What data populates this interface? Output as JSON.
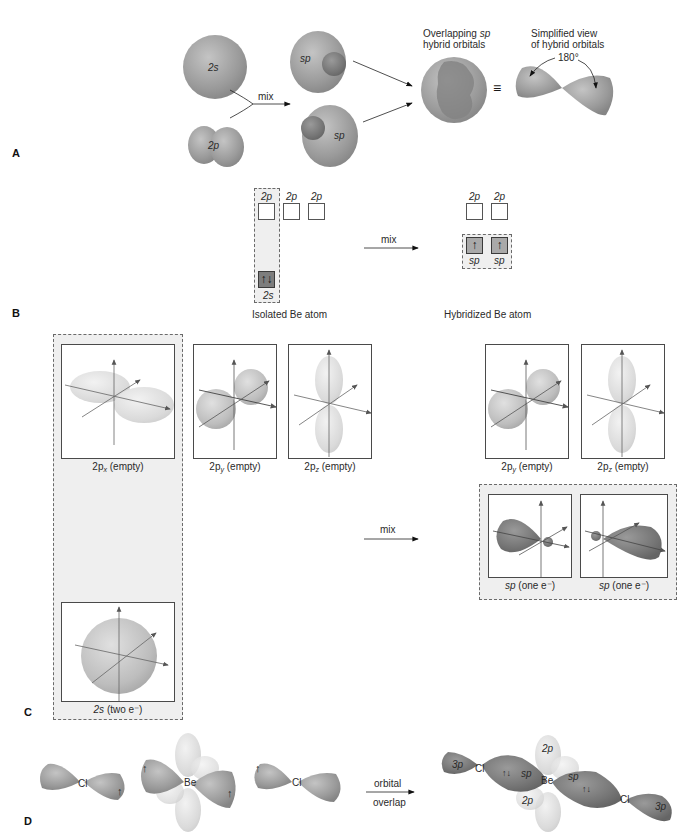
{
  "panels": {
    "A": {
      "letter": "A",
      "s_orbital_label": "2s",
      "p_orbital_label": "2p",
      "mix_label": "mix",
      "sp_top_label": "sp",
      "sp_bottom_label": "sp",
      "overlap_title_line1": "Overlapping ",
      "overlap_title_italic": "sp",
      "overlap_title_line2": "hybrid orbitals",
      "equiv_symbol": "≡",
      "simplified_title_line1": "Simplified view",
      "simplified_title_line2": "of hybrid orbitals",
      "angle_label": "180°"
    },
    "B": {
      "letter": "B",
      "isolated": {
        "caption": "Isolated Be atom",
        "p_labels": [
          "2p",
          "2p",
          "2p"
        ],
        "s_label": "2s",
        "s_electrons": "↑↓"
      },
      "mix_label": "mix",
      "hybridized": {
        "caption": "Hybridized Be atom",
        "p_labels": [
          "2p",
          "2p"
        ],
        "sp_labels": [
          "sp",
          "sp"
        ],
        "sp_electrons": [
          "↑",
          "↑"
        ]
      }
    },
    "C": {
      "letter": "C",
      "isolated": {
        "px": {
          "main": "2p",
          "sub": "x",
          "rest": " (empty)"
        },
        "py": {
          "main": "2p",
          "sub": "y",
          "rest": " (empty)"
        },
        "pz": {
          "main": "2p",
          "sub": "z",
          "rest": " (empty)"
        },
        "s": {
          "main": "2s",
          "rest": " (two e⁻)"
        }
      },
      "mix_label": "mix",
      "hybridized": {
        "py": {
          "main": "2p",
          "sub": "y",
          "rest": " (empty)"
        },
        "pz": {
          "main": "2p",
          "sub": "z",
          "rest": " (empty)"
        },
        "sp1": {
          "main": "sp",
          "rest": " (one e⁻)"
        },
        "sp2": {
          "main": "sp",
          "rest": " (one e⁻)"
        }
      }
    },
    "D": {
      "letter": "D",
      "left_cl": "Cl",
      "be": "Be",
      "right_cl": "Cl",
      "electron_up": "↑",
      "arrow_label_line1": "orbital",
      "arrow_label_line2": "overlap",
      "product": {
        "left_3p": "3p",
        "left_cl": "Cl",
        "left_pair": "↑↓",
        "left_sp": "sp",
        "top_2p": "2p",
        "be": "Be",
        "bottom_2p": "2p",
        "right_sp": "sp",
        "right_pair": "↑↓",
        "right_cl": "Cl",
        "right_3p": "3p"
      }
    }
  },
  "colors": {
    "orbital_fill": "#9c9c9c",
    "orbital_dark": "#7a7a7a",
    "orbital_light": "#dcdcdc",
    "box_border": "#4a4a4a",
    "dashed_fill": "#efefef"
  }
}
